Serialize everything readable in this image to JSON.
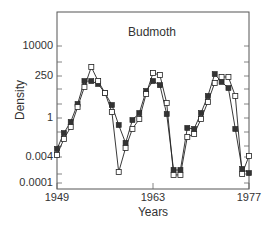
{
  "chart_data": {
    "type": "line",
    "title": "Budmoth",
    "xlabel": "Years",
    "ylabel": "Density",
    "yscale": "log",
    "xlim": [
      1949,
      1977
    ],
    "ylim": [
      0.0001,
      100000
    ],
    "x_ticks": [
      1949,
      1963,
      1977
    ],
    "x_tick_labels": [
      "1949",
      "1963",
      "1977"
    ],
    "y_ticks": [
      10000,
      250,
      1,
      0.004,
      0.0001
    ],
    "y_tick_labels": [
      "10000",
      "250",
      "1",
      "0.004",
      "0.0001"
    ],
    "grid": false,
    "legend": null,
    "x": [
      1949,
      1950,
      1951,
      1952,
      1953,
      1954,
      1955,
      1956,
      1957,
      1958,
      1959,
      1960,
      1961,
      1962,
      1963,
      1964,
      1965,
      1966,
      1967,
      1968,
      1969,
      1970,
      1971,
      1972,
      1973,
      1974,
      1975,
      1976,
      1977
    ],
    "series": [
      {
        "name": "Observed (filled squares)",
        "marker": "filled-square",
        "log10_values": [
          -1.81,
          -0.88,
          -0.23,
          0.82,
          2.16,
          2.16,
          1.99,
          1.46,
          0.76,
          -0.41,
          -1.46,
          -0.12,
          0.29,
          1.58,
          2.16,
          1.92,
          0.23,
          -3.04,
          -3.04,
          -0.58,
          -0.64,
          0.29,
          1.29,
          2.57,
          2.11,
          1.75,
          -0.64,
          -2.98,
          -3.22
        ]
      },
      {
        "name": "Model (open squares)",
        "marker": "open-square",
        "log10_values": [
          -2.16,
          -1.23,
          -0.53,
          0.64,
          1.81,
          2.98,
          2.16,
          1.46,
          0.35,
          -3.16,
          -1.75,
          -0.64,
          -0.06,
          1.4,
          2.63,
          2.51,
          0.88,
          -3.33,
          -3.33,
          -1.11,
          -0.94,
          -0.06,
          0.94,
          2.05,
          2.4,
          2.4,
          1.29,
          -3.27,
          -2.22
        ]
      }
    ]
  }
}
